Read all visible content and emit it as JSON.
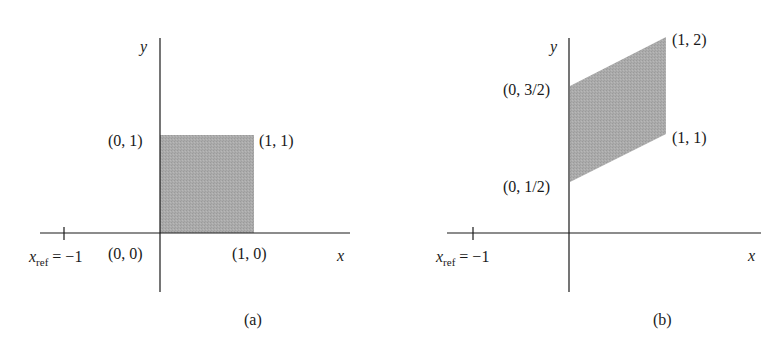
{
  "figure": {
    "panels": [
      {
        "id": "a",
        "caption": "(a)",
        "axis_labels": {
          "x": "x",
          "y": "y"
        },
        "ref_label": {
          "var": "x",
          "sub": "ref",
          "rest": " = −1"
        },
        "vertex_labels": {
          "origin": "(0, 0)",
          "x1": "(1, 0)",
          "top_left": "(0, 1)",
          "top_right": "(1, 1)"
        },
        "shape": "unit square",
        "vertices": [
          [
            0,
            0
          ],
          [
            1,
            0
          ],
          [
            1,
            1
          ],
          [
            0,
            1
          ]
        ]
      },
      {
        "id": "b",
        "caption": "(b)",
        "axis_labels": {
          "x": "x",
          "y": "y"
        },
        "ref_label": {
          "var": "x",
          "sub": "ref",
          "rest": " = −1"
        },
        "vertex_labels": {
          "top_right": "(1, 2)",
          "top_left": "(0, 3/2)",
          "bottom_right": "(1, 1)",
          "bottom_left": "(0, 1/2)"
        },
        "shape": "parallelogram",
        "vertices": [
          [
            0,
            0.5
          ],
          [
            1,
            1
          ],
          [
            1,
            2
          ],
          [
            0,
            1.5
          ]
        ]
      }
    ],
    "colors": {
      "fill": "#a9a9a9",
      "axis": "#1a1a1a",
      "background": "#ffffff"
    }
  }
}
